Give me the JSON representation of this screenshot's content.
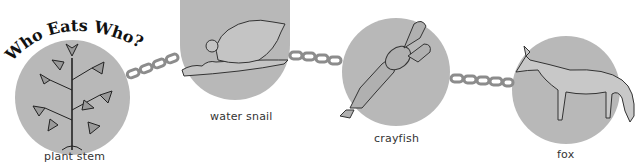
{
  "title": "Who Eats Who?",
  "colors": {
    "circle_fill": "#b8b8b8",
    "chain": "#8c8c8c",
    "ink": "#333333",
    "background": "#ffffff"
  },
  "food_chain": [
    {
      "label": "plant stem",
      "icon": "plant-icon"
    },
    {
      "label": "water snail",
      "icon": "snail-icon"
    },
    {
      "label": "crayfish",
      "icon": "crayfish-icon"
    },
    {
      "label": "fox",
      "icon": "fox-icon"
    }
  ],
  "connectors": [
    {
      "from": "plant stem",
      "to": "water snail",
      "icon": "chain-icon"
    },
    {
      "from": "water snail",
      "to": "crayfish",
      "icon": "chain-icon"
    },
    {
      "from": "crayfish",
      "to": "fox",
      "icon": "chain-icon"
    }
  ]
}
